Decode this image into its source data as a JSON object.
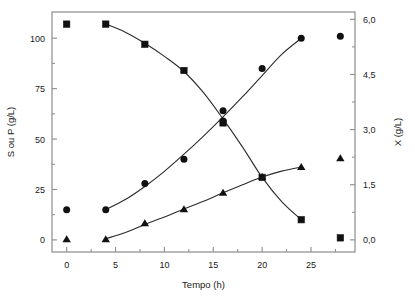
{
  "chart_data": {
    "type": "scatter",
    "title": "",
    "subtitle": "",
    "xlabel": "Tempo (h)",
    "ylabel": "S ou P (g/L)",
    "y2label": "X (g/L)",
    "xlim": [
      -1.5,
      29.5
    ],
    "ylim": [
      -6,
      113
    ],
    "y2lim": [
      -0.33,
      6.2
    ],
    "xticks": [
      0,
      5,
      10,
      15,
      20,
      25
    ],
    "xticklabels": [
      "0",
      "5",
      "10",
      "15",
      "20",
      "25"
    ],
    "yticks": [
      0,
      25,
      50,
      75,
      100
    ],
    "yticklabels": [
      "0",
      "25",
      "50",
      "75",
      "100"
    ],
    "y2ticks": [
      0.0,
      1.5,
      3.0,
      4.5,
      6.0
    ],
    "y2ticklabels": [
      "0,0",
      "1,5",
      "3,0",
      "4,5",
      "6,0"
    ],
    "xminorticks": [
      2.5,
      7.5,
      12.5,
      17.5,
      22.5,
      27.5
    ],
    "yminorticks": [
      12.5,
      37.5,
      62.5,
      87.5
    ],
    "y2minorticks": [
      0.75,
      2.25,
      3.75,
      5.25
    ],
    "grid": false,
    "legend": "none",
    "marker_color": "#111111",
    "line_color": "#2b2b2b",
    "frame_color": "#8c8c8c",
    "series": [
      {
        "name": "S",
        "axis": "left",
        "marker": "square",
        "x": [
          0,
          4,
          8,
          12,
          16,
          20,
          24,
          28
        ],
        "y": [
          107,
          107,
          97,
          84,
          58,
          31,
          10,
          1
        ],
        "fit_x": [
          4,
          6,
          8,
          10,
          12,
          14,
          16,
          18,
          20,
          22,
          24
        ],
        "fit_y": [
          107,
          103,
          97.5,
          91,
          83.5,
          73,
          60,
          46,
          31,
          19,
          10
        ]
      },
      {
        "name": "P",
        "axis": "left",
        "marker": "circle",
        "x": [
          0,
          4,
          8,
          12,
          16,
          16,
          20,
          24,
          28
        ],
        "y": [
          15,
          15,
          28,
          40,
          64,
          59,
          85,
          100,
          101
        ],
        "fit_x": [
          4,
          6,
          8,
          10,
          12,
          14,
          16,
          18,
          20,
          22,
          24
        ],
        "fit_y": [
          15,
          20,
          26.5,
          34,
          42.5,
          51.5,
          61,
          71,
          81.5,
          92,
          100
        ]
      },
      {
        "name": "X",
        "axis": "right",
        "marker": "triangle",
        "x": [
          0,
          4,
          8,
          12,
          16,
          20,
          24,
          28
        ],
        "y": [
          0.02,
          0.02,
          0.45,
          0.83,
          1.28,
          1.72,
          1.98,
          2.22
        ],
        "fit_x": [
          4,
          6,
          8,
          10,
          12,
          14,
          16,
          18,
          20,
          22,
          24
        ],
        "fit_y": [
          0.03,
          0.2,
          0.42,
          0.62,
          0.84,
          1.05,
          1.28,
          1.5,
          1.71,
          1.87,
          1.98
        ]
      }
    ]
  }
}
